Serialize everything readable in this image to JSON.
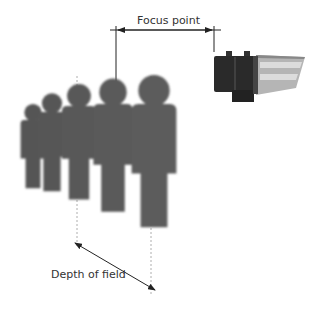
{
  "diagram": {
    "labels": {
      "focus_point": "Focus point",
      "depth_of_field": "Depth of field"
    },
    "colors": {
      "figure": "#5a5a5a",
      "figure_shadow": "#3e3e3e",
      "line": "#222222",
      "dashed": "#999999",
      "camera_body": "#2a2a2a",
      "camera_hood": "#b8b8b8"
    },
    "elements": {
      "camera": "cctv-camera-icon",
      "people": "person-silhouette-icon",
      "people_count": 5
    }
  }
}
